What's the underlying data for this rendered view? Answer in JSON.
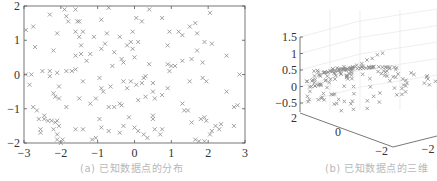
{
  "figure": {
    "panels": [
      {
        "id": "a",
        "caption": "(a) 已知数据点的分布"
      },
      {
        "id": "b",
        "caption": "(b) 已知数据点的三维"
      }
    ]
  },
  "chart_data": [
    {
      "type": "scatter",
      "title": "(a) 已知数据点的分布",
      "xlabel": "",
      "ylabel": "",
      "xlim": [
        -3,
        3
      ],
      "ylim": [
        -2,
        2
      ],
      "xticks": [
        "-3",
        "-2",
        "-1",
        "0",
        "1",
        "2",
        "3"
      ],
      "yticks": [
        "-2",
        "-1",
        "0",
        "1",
        "2"
      ],
      "marker": "x",
      "marker_color": "#8a8a8a",
      "grid": false,
      "points": [
        [
          -2.95,
          1.3
        ],
        [
          -2.7,
          0.8
        ],
        [
          -2.75,
          1.4
        ],
        [
          -2.3,
          1.75
        ],
        [
          -2.2,
          0.7
        ],
        [
          -2.1,
          1.2
        ],
        [
          -1.9,
          1.9
        ],
        [
          -1.85,
          1.7
        ],
        [
          -1.8,
          1.55
        ],
        [
          -1.6,
          1.9
        ],
        [
          -1.55,
          1.55
        ],
        [
          -1.5,
          1.55
        ],
        [
          -1.6,
          1.25
        ],
        [
          -1.4,
          1.25
        ],
        [
          -1.45,
          0.85
        ],
        [
          -1.45,
          0.6
        ],
        [
          -1.6,
          0.55
        ],
        [
          -1.5,
          1.1
        ],
        [
          -1.2,
          0.6
        ],
        [
          -1.3,
          0.4
        ],
        [
          -1.1,
          1.1
        ],
        [
          -0.9,
          0.75
        ],
        [
          -0.8,
          0.9
        ],
        [
          -0.75,
          1.2
        ],
        [
          -0.9,
          1.6
        ],
        [
          -0.7,
          1.95
        ],
        [
          -0.55,
          0.65
        ],
        [
          -0.6,
          0.25
        ],
        [
          -0.4,
          1.1
        ],
        [
          -0.35,
          0.45
        ],
        [
          -0.3,
          0.35
        ],
        [
          -0.2,
          0.85
        ],
        [
          -0.1,
          0.95
        ],
        [
          -0.05,
          0.75
        ],
        [
          0.0,
          0.5
        ],
        [
          -0.05,
          1.25
        ],
        [
          0.05,
          1.65
        ],
        [
          0.2,
          1.55
        ],
        [
          0.1,
          0.95
        ],
        [
          0.4,
          1.9
        ],
        [
          0.75,
          1.65
        ],
        [
          0.95,
          1.25
        ],
        [
          1.2,
          1.25
        ],
        [
          1.3,
          1.15
        ],
        [
          0.9,
          0.85
        ],
        [
          1.5,
          1.4
        ],
        [
          1.65,
          1.5
        ],
        [
          1.7,
          1.2
        ],
        [
          1.9,
          0.95
        ],
        [
          2.05,
          1.8
        ],
        [
          2.1,
          0.9
        ],
        [
          2.5,
          0.55
        ],
        [
          1.7,
          0.7
        ],
        [
          1.85,
          0.35
        ],
        [
          1.55,
          0.45
        ],
        [
          1.3,
          0.4
        ],
        [
          0.9,
          0.3
        ],
        [
          0.4,
          0.3
        ],
        [
          -2.95,
          0.0
        ],
        [
          -2.8,
          0.0
        ],
        [
          -2.85,
          -0.3
        ],
        [
          -2.5,
          0.1
        ],
        [
          -2.3,
          0.1
        ],
        [
          -2.3,
          -0.05
        ],
        [
          -2.1,
          0.05
        ],
        [
          -2.05,
          -0.35
        ],
        [
          -1.85,
          0.1
        ],
        [
          -1.7,
          0.1
        ],
        [
          -1.6,
          0.15
        ],
        [
          -1.4,
          -0.2
        ],
        [
          -2.2,
          -0.55
        ],
        [
          -2.15,
          -0.65
        ],
        [
          -2.05,
          -0.7
        ],
        [
          -1.85,
          -0.95
        ],
        [
          -1.5,
          -0.7
        ],
        [
          -1.2,
          -0.85
        ],
        [
          -1.05,
          -0.7
        ],
        [
          -0.95,
          -0.1
        ],
        [
          -0.9,
          -0.4
        ],
        [
          -0.85,
          -0.5
        ],
        [
          -0.65,
          -0.35
        ],
        [
          -0.7,
          -0.95
        ],
        [
          -0.55,
          -0.95
        ],
        [
          -0.4,
          -0.85
        ],
        [
          -0.35,
          -0.9
        ],
        [
          -0.3,
          -0.2
        ],
        [
          -0.2,
          -0.4
        ],
        [
          -0.1,
          -0.2
        ],
        [
          0.05,
          -0.3
        ],
        [
          0.2,
          -0.25
        ],
        [
          0.3,
          -0.05
        ],
        [
          0.25,
          -0.1
        ],
        [
          0.5,
          -0.25
        ],
        [
          0.5,
          -0.5
        ],
        [
          0.55,
          -0.7
        ],
        [
          0.1,
          -0.75
        ],
        [
          0.3,
          -0.65
        ],
        [
          0.75,
          -0.6
        ],
        [
          0.9,
          -0.4
        ],
        [
          0.95,
          0.1
        ],
        [
          1.1,
          0.25
        ],
        [
          1.0,
          0.25
        ],
        [
          1.5,
          -0.2
        ],
        [
          1.85,
          -0.1
        ],
        [
          1.95,
          -0.2
        ],
        [
          2.5,
          -0.5
        ],
        [
          2.85,
          0.0
        ],
        [
          2.7,
          -0.95
        ],
        [
          2.8,
          -0.9
        ],
        [
          -2.75,
          -0.95
        ],
        [
          -2.65,
          -1.05
        ],
        [
          -2.6,
          -1.3
        ],
        [
          -2.45,
          -1.2
        ],
        [
          -2.45,
          -1.3
        ],
        [
          -2.35,
          -1.35
        ],
        [
          -2.25,
          -1.35
        ],
        [
          -2.15,
          -1.4
        ],
        [
          -2.05,
          -1.5
        ],
        [
          -2.1,
          -1.35
        ],
        [
          -2.55,
          -1.6
        ],
        [
          -2.55,
          -1.7
        ],
        [
          -2.2,
          -1.6
        ],
        [
          -2.1,
          -1.75
        ],
        [
          -2.1,
          -1.9
        ],
        [
          -2.0,
          -2.0
        ],
        [
          -1.95,
          -1.9
        ],
        [
          -1.6,
          -1.6
        ],
        [
          -1.4,
          -1.6
        ],
        [
          -1.15,
          -1.9
        ],
        [
          -1.05,
          -1.85
        ],
        [
          -0.95,
          -1.3
        ],
        [
          -0.9,
          -1.55
        ],
        [
          -0.7,
          -1.65
        ],
        [
          -0.4,
          -1.7
        ],
        [
          -0.3,
          -1.5
        ],
        [
          -0.15,
          -1.25
        ],
        [
          0.0,
          -1.55
        ],
        [
          0.1,
          -1.65
        ],
        [
          0.25,
          -1.75
        ],
        [
          0.35,
          -1.85
        ],
        [
          0.5,
          -1.3
        ],
        [
          0.5,
          -1.2
        ],
        [
          0.55,
          -1.6
        ],
        [
          0.7,
          -1.75
        ],
        [
          0.75,
          -1.6
        ],
        [
          1.3,
          -0.85
        ],
        [
          1.35,
          -1.05
        ],
        [
          1.45,
          -1.05
        ],
        [
          1.55,
          -1.4
        ],
        [
          1.65,
          -1.9
        ],
        [
          1.75,
          -1.95
        ],
        [
          1.8,
          -1.3
        ],
        [
          1.9,
          -1.25
        ],
        [
          1.95,
          -1.35
        ],
        [
          2.05,
          -1.75
        ],
        [
          1.9,
          -1.95
        ],
        [
          2.2,
          -1.5
        ],
        [
          2.3,
          -1.6
        ],
        [
          2.35,
          -1.45
        ],
        [
          2.1,
          -1.65
        ],
        [
          2.7,
          -1.5
        ]
      ]
    },
    {
      "type": "scatter3d",
      "title": "(b) 已知数据点的三维",
      "zticks": [
        "-0.5",
        "0",
        "0.5",
        "1",
        "1.5"
      ],
      "yticks": [
        "2",
        "0",
        "-2"
      ],
      "xticks": [
        "-2"
      ],
      "zlim": [
        -0.5,
        1.5
      ],
      "marker": "x",
      "marker_color": "#8a8a8a",
      "grid": true
    }
  ]
}
